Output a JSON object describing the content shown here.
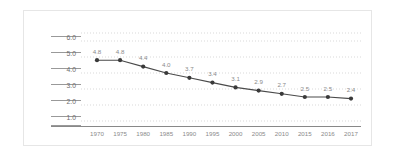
{
  "chart_data": {
    "type": "line",
    "title": "",
    "subtitle": "",
    "xlabel": "",
    "ylabel": "",
    "categories": [
      "1970",
      "1975",
      "1980",
      "1985",
      "1990",
      "1995",
      "2000",
      "2005",
      "2010",
      "2015",
      "2016",
      "2017"
    ],
    "values": [
      4.8,
      4.8,
      4.4,
      4.0,
      3.7,
      3.4,
      3.1,
      2.9,
      2.7,
      2.5,
      2.5,
      2.4
    ],
    "point_labels": [
      "4.8",
      "4.8",
      "4.4",
      "4.0",
      "3.7",
      "3.4",
      "3.1",
      "2.9",
      "2.7",
      "2.5",
      "2.5",
      "2.4"
    ],
    "ylim": [
      0.0,
      6.5
    ],
    "yticks": [
      1.0,
      2.0,
      3.0,
      4.0,
      5.0,
      6.0
    ],
    "ytick_labels": [
      "1.0",
      "2.0",
      "3.0",
      "4.0",
      "5.0",
      "6.0"
    ],
    "grid": true,
    "grid_style": "dotted-horizontal",
    "legend": null,
    "legend_position": "none",
    "series": [
      {
        "name": "",
        "values": [
          4.8,
          4.8,
          4.4,
          4.0,
          3.7,
          3.4,
          3.1,
          2.9,
          2.7,
          2.5,
          2.5,
          2.4
        ]
      }
    ]
  },
  "style": {
    "line_color": "#4a4a4a",
    "marker_color": "#3a3a3a",
    "grid_color": "#c9c9c9",
    "axis_color": "#8d8d8d",
    "label_color": "#8a8a8a",
    "ytick_color": "#6e6e6e",
    "card_border_color": "#e6e6e6",
    "background": "#ffffff"
  }
}
